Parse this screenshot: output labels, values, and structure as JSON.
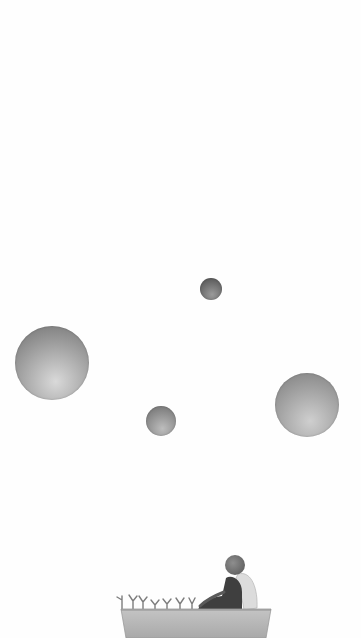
{
  "scene": {
    "description": "Minimal grayscale illustration wallpaper",
    "background": "#fefefe",
    "planets": [
      {
        "name": "large-left",
        "cx": 52,
        "cy": 363,
        "r": 37,
        "light": "#d9d9d9",
        "dark": "#6f6f6f"
      },
      {
        "name": "small-top",
        "cx": 211,
        "cy": 289,
        "r": 11,
        "light": "#9a9a9a",
        "dark": "#4a4a4a"
      },
      {
        "name": "small-middle",
        "cx": 161,
        "cy": 421,
        "r": 15,
        "light": "#bdbdbd",
        "dark": "#6a6a6a"
      },
      {
        "name": "large-right",
        "cx": 307,
        "cy": 405,
        "r": 32,
        "light": "#cfcfcf",
        "dark": "#7c7c7c"
      }
    ],
    "boat": {
      "x": 121,
      "y": 609,
      "width": 150,
      "color": "#b8b8b8",
      "rim": "#9a9a9a"
    },
    "figure": {
      "head_color": "#7a7a7a",
      "body_color": "#3e3e3e",
      "wing_color": "#dadada"
    },
    "sprouts_count": 7
  }
}
